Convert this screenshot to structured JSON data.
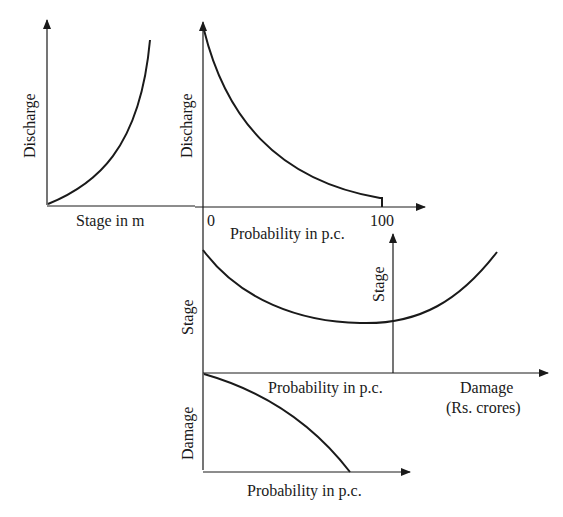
{
  "diagram": {
    "colors": {
      "ink": "#1a1a1a",
      "background": "#ffffff"
    },
    "panels": {
      "stage_discharge": {
        "ylabel": "Discharge",
        "xlabel": "Stage in m"
      },
      "discharge_probability": {
        "ylabel": "Discharge",
        "xlabel": "Probability in p.c.",
        "tick_start": "0",
        "tick_end": "100"
      },
      "stage_probability": {
        "ylabel": "Stage",
        "xlabel": "Probability in p.c."
      },
      "stage_damage": {
        "ylabel": "Stage",
        "xlabel_line1": "Damage",
        "xlabel_line2": "(Rs. crores)"
      },
      "damage_probability": {
        "ylabel": "Damage",
        "xlabel": "Probability in p.c."
      }
    }
  }
}
